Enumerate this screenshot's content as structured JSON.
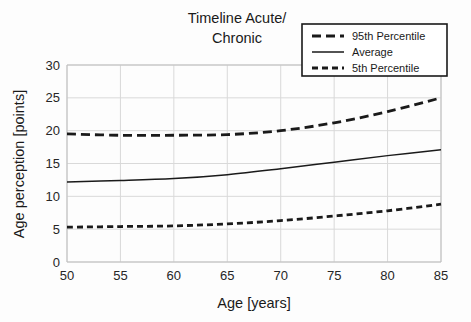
{
  "chart_data": {
    "type": "line",
    "title": "Timeline Acute/ Chronic",
    "title_line1": "Timeline Acute/",
    "title_line2": "Chronic",
    "xlabel": "Age [years]",
    "ylabel": "Age perception [points]",
    "xlim": [
      50,
      85
    ],
    "ylim": [
      0,
      30
    ],
    "xticks": [
      50,
      55,
      60,
      65,
      70,
      75,
      80,
      85
    ],
    "yticks": [
      0,
      5,
      10,
      15,
      20,
      25,
      30
    ],
    "xtick_labels": [
      "50",
      "55",
      "60",
      "65",
      "70",
      "75",
      "80",
      "85"
    ],
    "ytick_labels": [
      "0",
      "5",
      "10",
      "15",
      "20",
      "25",
      "30"
    ],
    "grid": true,
    "legend_position": "top-right",
    "x": [
      50,
      55,
      60,
      65,
      70,
      75,
      80,
      85
    ],
    "series": [
      {
        "name": "95th Percentile",
        "style": "dashed",
        "color": "#1a1a1a",
        "width": 2.8,
        "dash": "9,5",
        "values": [
          19.5,
          19.3,
          19.3,
          19.4,
          20.0,
          21.2,
          22.9,
          25.0
        ]
      },
      {
        "name": "Average",
        "style": "solid",
        "color": "#1a1a1a",
        "width": 1.5,
        "dash": "none",
        "values": [
          12.2,
          12.4,
          12.7,
          13.3,
          14.2,
          15.2,
          16.2,
          17.1
        ]
      },
      {
        "name": "5th Percentile",
        "style": "dashed",
        "color": "#1a1a1a",
        "width": 2.8,
        "dash": "6,4",
        "values": [
          5.3,
          5.4,
          5.5,
          5.8,
          6.3,
          7.0,
          7.8,
          8.8
        ]
      }
    ]
  },
  "legend": {
    "entries": [
      {
        "label": "95th Percentile",
        "style": "dashed",
        "dash": "9,5",
        "width": 2.8
      },
      {
        "label": "Average",
        "style": "solid",
        "dash": "none",
        "width": 1.5
      },
      {
        "label": "5th Percentile",
        "style": "dashed",
        "dash": "6,4",
        "width": 2.8
      }
    ]
  },
  "colors": {
    "background": "#fdfdfd",
    "ink": "#1a1a1a",
    "grid": "#d9d9d9",
    "axis": "#bfbfbf"
  }
}
